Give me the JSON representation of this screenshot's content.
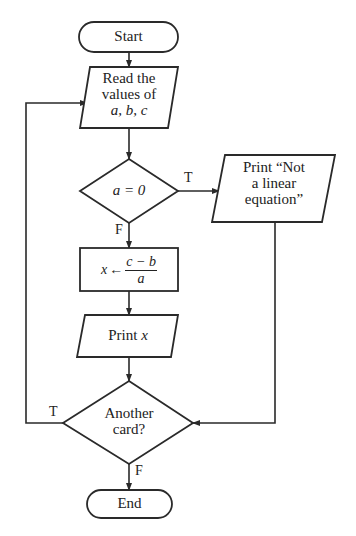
{
  "diagram": {
    "type": "flowchart",
    "nodes": [
      {
        "id": "start",
        "shape": "terminal",
        "label": "Start"
      },
      {
        "id": "read",
        "shape": "parallelogram",
        "label": "Read the\nvalues of",
        "label_italic": "a, b, c"
      },
      {
        "id": "cond_a",
        "shape": "diamond",
        "label": "a = 0"
      },
      {
        "id": "print_not",
        "shape": "parallelogram",
        "label": "Print “Not\na linear\nequation”"
      },
      {
        "id": "compute",
        "shape": "rectangle",
        "label_var": "x",
        "label_arrow": "←",
        "numerator": "c − b",
        "denominator": "a"
      },
      {
        "id": "print_x",
        "shape": "parallelogram",
        "label": "Print",
        "label_italic": "x"
      },
      {
        "id": "cond_card",
        "shape": "diamond",
        "label": "Another\ncard?"
      },
      {
        "id": "end",
        "shape": "terminal",
        "label": "End"
      }
    ],
    "edges": [
      {
        "from": "start",
        "to": "read",
        "label": ""
      },
      {
        "from": "read",
        "to": "cond_a",
        "label": ""
      },
      {
        "from": "cond_a",
        "to": "print_not",
        "label": "T"
      },
      {
        "from": "cond_a",
        "to": "compute",
        "label": "F"
      },
      {
        "from": "compute",
        "to": "print_x",
        "label": ""
      },
      {
        "from": "print_x",
        "to": "cond_card",
        "label": ""
      },
      {
        "from": "print_not",
        "to": "cond_card",
        "label": ""
      },
      {
        "from": "cond_card",
        "to": "read",
        "label": "T"
      },
      {
        "from": "cond_card",
        "to": "end",
        "label": "F"
      }
    ],
    "edge_labels": {
      "cond_a_true": "T",
      "cond_a_false": "F",
      "cond_card_true": "T",
      "cond_card_false": "F"
    },
    "colors": {
      "stroke": "#2a2a2a",
      "fill": "#ffffff",
      "text": "#222222"
    }
  }
}
